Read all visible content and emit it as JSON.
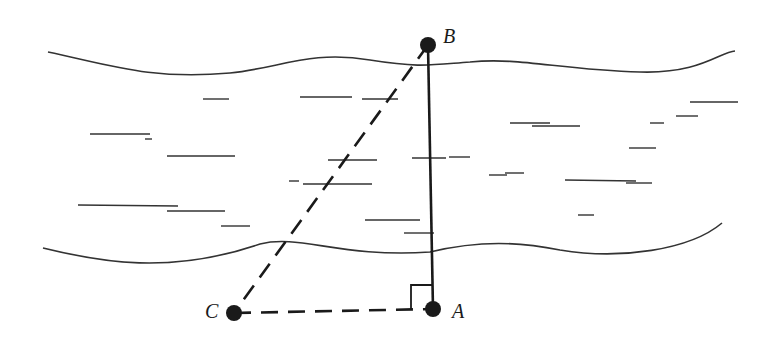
{
  "diagram": {
    "type": "geometry-river-width",
    "colors": {
      "ink": "#1a1a1a",
      "water_lines": "#333333",
      "background": "#ffffff"
    },
    "points": [
      {
        "id": "B",
        "label": "B",
        "x": 428,
        "y": 45,
        "label_x": 443,
        "label_y": 43
      },
      {
        "id": "A",
        "label": "A",
        "x": 433,
        "y": 309,
        "label_x": 452,
        "label_y": 318
      },
      {
        "id": "C",
        "label": "C",
        "x": 234,
        "y": 313,
        "label_x": 205,
        "label_y": 318
      }
    ],
    "segments": [
      {
        "from": "A",
        "to": "B",
        "style": "solid"
      },
      {
        "from": "B",
        "to": "C",
        "style": "dashed"
      },
      {
        "from": "C",
        "to": "A",
        "style": "dashed"
      }
    ],
    "right_angle": {
      "at": "A",
      "size": 24
    },
    "riverbanks": [
      {
        "name": "far-bank",
        "path": "M 48 52 C 110 65, 150 80, 230 73 C 280 68, 310 50, 370 60 C 420 68, 430 65, 470 62 C 520 57, 560 70, 640 72 C 700 74, 720 52, 735 51"
      },
      {
        "name": "near-bank",
        "path": "M 43 248 C 100 262, 170 275, 260 244 C 300 234, 340 258, 430 252 C 480 240, 520 242, 560 250 C 620 260, 690 250, 722 223"
      }
    ],
    "water_strokes": [
      [
        203,
        99,
        229,
        99
      ],
      [
        300,
        97,
        352,
        97
      ],
      [
        362,
        99,
        398,
        99
      ],
      [
        510,
        123,
        550,
        123
      ],
      [
        532,
        126,
        580,
        126
      ],
      [
        650,
        123,
        664,
        123
      ],
      [
        676,
        116,
        698,
        116
      ],
      [
        690,
        102,
        738,
        102
      ],
      [
        90,
        134,
        150,
        134
      ],
      [
        145,
        139,
        152,
        139
      ],
      [
        167,
        156,
        235,
        156
      ],
      [
        328,
        160,
        377,
        160
      ],
      [
        412,
        158,
        446,
        158
      ],
      [
        449,
        157,
        470,
        157
      ],
      [
        629,
        148,
        656,
        148
      ],
      [
        289,
        181,
        299,
        181
      ],
      [
        303,
        184,
        372,
        184
      ],
      [
        489,
        175,
        507,
        175
      ],
      [
        505,
        173,
        524,
        173
      ],
      [
        565,
        180,
        636,
        181
      ],
      [
        626,
        183,
        652,
        183
      ],
      [
        78,
        205,
        178,
        206
      ],
      [
        167,
        211,
        225,
        211
      ],
      [
        221,
        226,
        250,
        226
      ],
      [
        365,
        220,
        420,
        220
      ],
      [
        578,
        215,
        594,
        215
      ],
      [
        404,
        233,
        434,
        233
      ]
    ]
  }
}
